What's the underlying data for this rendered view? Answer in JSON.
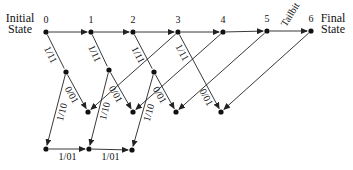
{
  "diagram": {
    "title_left": [
      "Initial",
      "State"
    ],
    "title_right": [
      "Final",
      "State"
    ],
    "colors": {
      "line": "#222222",
      "node": "#111111",
      "background": "#ffffff"
    },
    "nodes": [
      {
        "id": "t0",
        "x": 46,
        "y": 32,
        "label": "0"
      },
      {
        "id": "t1",
        "x": 91,
        "y": 32,
        "label": "1"
      },
      {
        "id": "t2",
        "x": 133,
        "y": 32,
        "label": "2"
      },
      {
        "id": "t3",
        "x": 178,
        "y": 32,
        "label": "3"
      },
      {
        "id": "t4",
        "x": 223,
        "y": 32,
        "label": "4"
      },
      {
        "id": "t5",
        "x": 267,
        "y": 31,
        "label": "5"
      },
      {
        "id": "t6",
        "x": 311,
        "y": 31,
        "label": "6"
      },
      {
        "id": "m0",
        "x": 66,
        "y": 72,
        "label": ""
      },
      {
        "id": "m1",
        "x": 109,
        "y": 70,
        "label": ""
      },
      {
        "id": "m2",
        "x": 154,
        "y": 72,
        "label": ""
      },
      {
        "id": "r0",
        "x": 88,
        "y": 112,
        "label": ""
      },
      {
        "id": "r1",
        "x": 133,
        "y": 112,
        "label": ""
      },
      {
        "id": "r2",
        "x": 176,
        "y": 112,
        "label": ""
      },
      {
        "id": "r3",
        "x": 221,
        "y": 112,
        "label": ""
      },
      {
        "id": "b0",
        "x": 46,
        "y": 149,
        "label": ""
      },
      {
        "id": "b1",
        "x": 89,
        "y": 149,
        "label": ""
      },
      {
        "id": "b2",
        "x": 132,
        "y": 150,
        "label": ""
      }
    ],
    "edges": [
      {
        "from": "t0",
        "to": "t1",
        "label": ""
      },
      {
        "from": "t1",
        "to": "t2",
        "label": ""
      },
      {
        "from": "t2",
        "to": "t3",
        "label": ""
      },
      {
        "from": "t3",
        "to": "t4",
        "label": ""
      },
      {
        "from": "t4",
        "to": "t5",
        "label": ""
      },
      {
        "from": "t5",
        "to": "t6",
        "label": "Tailbit"
      },
      {
        "from": "t0",
        "to": "m0",
        "label": "1/11",
        "arrow": false
      },
      {
        "from": "t1",
        "to": "m1",
        "label": "1/11",
        "arrow": false
      },
      {
        "from": "t2",
        "to": "m2",
        "label": "1/11",
        "arrow": false
      },
      {
        "from": "t3",
        "to": "r3",
        "label": "1/11",
        "label2": "0/01"
      },
      {
        "from": "m0",
        "to": "r0",
        "label": "0/01"
      },
      {
        "from": "m1",
        "to": "r1",
        "label": "0/01"
      },
      {
        "from": "m2",
        "to": "r2",
        "label": "0/01"
      },
      {
        "from": "m0",
        "to": "b0",
        "label": "1/10"
      },
      {
        "from": "m1",
        "to": "b1",
        "label": "1/10"
      },
      {
        "from": "m2",
        "to": "b2",
        "label": "1/10"
      },
      {
        "from": "t3",
        "to": "r0",
        "label": ""
      },
      {
        "from": "t4",
        "to": "r1",
        "label": ""
      },
      {
        "from": "t5",
        "to": "r2",
        "label": ""
      },
      {
        "from": "t6",
        "to": "r3",
        "label": ""
      },
      {
        "from": "b0",
        "to": "b1",
        "label": "1/01"
      },
      {
        "from": "b1",
        "to": "b2",
        "label": "1/01"
      }
    ]
  }
}
